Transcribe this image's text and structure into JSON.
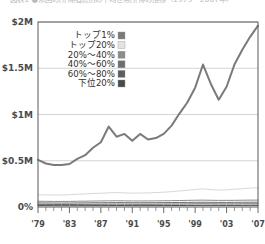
{
  "caption": {
    "text": "図表1 ●米国の所得階層別の平均世帯所得の推移（1979〜2007年）"
  },
  "chart_data": {
    "type": "line",
    "title": "",
    "subtitle": "",
    "xlabel": "",
    "ylabel": "",
    "grid": true,
    "legend_position": "inside-top-left",
    "x": [
      1979,
      1980,
      1981,
      1982,
      1983,
      1984,
      1985,
      1986,
      1987,
      1988,
      1989,
      1990,
      1991,
      1992,
      1993,
      1994,
      1995,
      1996,
      1997,
      1998,
      1999,
      2000,
      2001,
      2002,
      2003,
      2004,
      2005,
      2006,
      2007
    ],
    "xlim": [
      1979,
      2007
    ],
    "ylim": [
      0,
      2000000
    ],
    "x_tick_labels": [
      "'79",
      "'83",
      "'87",
      "'91",
      "'95",
      "'99",
      "'03",
      "'07"
    ],
    "x_tick_values": [
      1979,
      1983,
      1987,
      1991,
      1995,
      1999,
      2003,
      2007
    ],
    "y_tick_labels": [
      "0%",
      "$0.5M",
      "$1M",
      "$1.5M",
      "$2M"
    ],
    "y_tick_values": [
      0,
      500000,
      1000000,
      1500000,
      2000000
    ],
    "series": [
      {
        "name": "トップ1%",
        "color": "#7a7a7a",
        "swatch": "#7a7a7a",
        "style": "line",
        "values": [
          510000,
          470000,
          455000,
          455000,
          465000,
          520000,
          560000,
          640000,
          700000,
          870000,
          760000,
          790000,
          715000,
          790000,
          730000,
          745000,
          790000,
          880000,
          1010000,
          1130000,
          1290000,
          1540000,
          1330000,
          1160000,
          1300000,
          1540000,
          1700000,
          1840000,
          1960000
        ]
      },
      {
        "name": "トップ20%",
        "color": "#d8d8d8",
        "swatch": "#e3e3e3",
        "style": "line",
        "values": [
          132000,
          130000,
          129000,
          130000,
          133000,
          138000,
          141000,
          146000,
          149000,
          153000,
          156000,
          153000,
          150000,
          151000,
          152000,
          156000,
          160000,
          166000,
          173000,
          181000,
          189000,
          196000,
          188000,
          183000,
          185000,
          192000,
          198000,
          204000,
          208000
        ]
      },
      {
        "name": "20%〜40%",
        "color": "#8c8c8c",
        "swatch": "#8c8c8c",
        "style": "line",
        "values": [
          62000,
          61000,
          60000,
          60000,
          60500,
          62000,
          63000,
          64500,
          65500,
          66500,
          67500,
          66500,
          65500,
          65500,
          65500,
          66500,
          67500,
          68500,
          70000,
          71500,
          73000,
          74000,
          72500,
          71500,
          71500,
          72000,
          73000,
          74000,
          74500
        ]
      },
      {
        "name": "40%〜60%",
        "color": "#6e6e6e",
        "swatch": "#6e6e6e",
        "style": "line",
        "values": [
          44000,
          43500,
          43000,
          42500,
          43000,
          44000,
          44500,
          45500,
          46000,
          46500,
          47500,
          47000,
          46000,
          46000,
          46000,
          46500,
          47500,
          48000,
          49000,
          50000,
          51000,
          51500,
          50500,
          50000,
          50000,
          50500,
          51000,
          51500,
          52000
        ]
      },
      {
        "name": "60%〜80%",
        "color": "#5e5e5e",
        "swatch": "#5e5e5e",
        "style": "line",
        "values": [
          29000,
          28500,
          28000,
          27500,
          28000,
          28500,
          29000,
          29500,
          30000,
          30500,
          31000,
          30500,
          30000,
          30000,
          30000,
          30500,
          31000,
          31500,
          32000,
          33000,
          33500,
          34000,
          33500,
          33000,
          33000,
          33000,
          33500,
          34000,
          34000
        ]
      },
      {
        "name": "下位20%",
        "color": "#4a4a4a",
        "swatch": "#4a4a4a",
        "style": "line",
        "values": [
          15500,
          15000,
          14500,
          14000,
          14000,
          14500,
          14800,
          15000,
          15200,
          15400,
          15800,
          15500,
          15000,
          15000,
          15000,
          15200,
          15500,
          15800,
          16200,
          16800,
          17200,
          17500,
          17200,
          17000,
          17000,
          17000,
          17200,
          17400,
          17500
        ]
      }
    ]
  },
  "legend": {
    "entries": [
      {
        "label": "トップ1%"
      },
      {
        "label": "トップ20%"
      },
      {
        "label": "20%〜40%"
      },
      {
        "label": "40%〜60%"
      },
      {
        "label": "60%〜80%"
      },
      {
        "label": "下位20%"
      }
    ]
  },
  "colors": {
    "plot_border": "#5a5a5a",
    "gridline": "#c9c9c9",
    "axis_text": "#4a4a4a",
    "background": "#ffffff"
  }
}
